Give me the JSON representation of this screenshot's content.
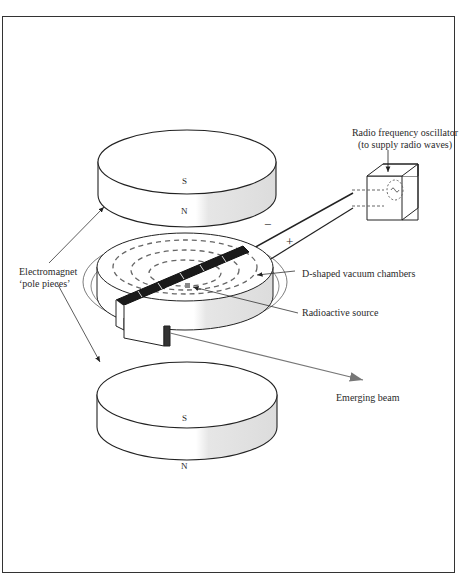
{
  "diagram": {
    "labels": {
      "oscillator_line1": "Radio frequency oscillator",
      "oscillator_line2": "(to supply radio waves)",
      "electromagnet_line1": "Electromagnet",
      "electromagnet_line2": "‘pole pieces’",
      "dees": "D-shaped vacuum chambers",
      "source": "Radioactive source",
      "beam": "Emerging beam",
      "top_magnet_south": "S",
      "top_magnet_north": "N",
      "bottom_magnet_south": "S",
      "bottom_magnet_north": "N",
      "minus": "−",
      "plus": "+"
    },
    "colors": {
      "stroke": "#222222",
      "shade": "#e2e2e2",
      "gap": "#1a1a1a",
      "dashes": "#666666",
      "beam": "#777777"
    }
  }
}
